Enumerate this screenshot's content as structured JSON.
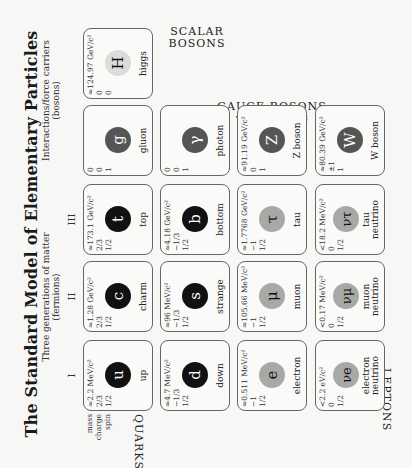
{
  "title": "The Standard Model of Elementary Particles",
  "fermions_caption": {
    "line1": "Three generations of matter",
    "line2": "(fermions)"
  },
  "bosons_caption": {
    "line1": "Interactions/force carriers",
    "line2": "(bosons)"
  },
  "generations": [
    "I",
    "II",
    "III"
  ],
  "row_labels": {
    "mass": "mass",
    "charge": "charge",
    "spin": "spin"
  },
  "group_labels": {
    "quarks": "QUARKS",
    "leptons": "LEPTONS",
    "scalar_bosons": "SCALAR BOSONS",
    "gauge_bosons": "GAUGE BOSONS",
    "vector_bosons": "VECTOR BOSONS"
  },
  "colors": {
    "quark": "#111111",
    "lepton": "#a8a8a6",
    "gauge": "#555555",
    "higgs": "#dcdcda"
  },
  "particles": {
    "up": {
      "mass": "≈2.2 MeV/c²",
      "charge": "2/3",
      "spin": "1/2",
      "symbol": "u",
      "name": "up"
    },
    "charm": {
      "mass": "≈1.28 GeV/c²",
      "charge": "2/3",
      "spin": "1/2",
      "symbol": "c",
      "name": "charm"
    },
    "top": {
      "mass": "≈173.1 GeV/c²",
      "charge": "2/3",
      "spin": "1/2",
      "symbol": "t",
      "name": "top"
    },
    "gluon": {
      "mass": "0",
      "charge": "0",
      "spin": "1",
      "symbol": "g",
      "name": "gluon"
    },
    "higgs": {
      "mass": "≈124.97 GeV/c²",
      "charge": "0",
      "spin": "0",
      "symbol": "H",
      "name": "higgs"
    },
    "down": {
      "mass": "≈4.7 MeV/c²",
      "charge": "−1/3",
      "spin": "1/2",
      "symbol": "d",
      "name": "down"
    },
    "strange": {
      "mass": "≈96 MeV/c²",
      "charge": "−1/3",
      "spin": "1/2",
      "symbol": "s",
      "name": "strange"
    },
    "bottom": {
      "mass": "≈4.18 GeV/c²",
      "charge": "−1/3",
      "spin": "1/2",
      "symbol": "b",
      "name": "bottom"
    },
    "photon": {
      "mass": "0",
      "charge": "0",
      "spin": "1",
      "symbol": "γ",
      "name": "photon"
    },
    "electron": {
      "mass": "≈0.511 MeV/c²",
      "charge": "−1",
      "spin": "1/2",
      "symbol": "e",
      "name": "electron"
    },
    "muon": {
      "mass": "≈105.66 MeV/c²",
      "charge": "−1",
      "spin": "1/2",
      "symbol": "μ",
      "name": "muon"
    },
    "tau": {
      "mass": "≈1.7768 GeV/c²",
      "charge": "−1",
      "spin": "1/2",
      "symbol": "τ",
      "name": "tau"
    },
    "zboson": {
      "mass": "≈91.19 GeV/c²",
      "charge": "0",
      "spin": "1",
      "symbol": "Z",
      "name": "Z boson"
    },
    "enu": {
      "mass": "<2.2 eV/c²",
      "charge": "0",
      "spin": "1/2",
      "symbol": "νe",
      "name1": "electron",
      "name2": "neutrino"
    },
    "munu": {
      "mass": "<0.17 MeV/c²",
      "charge": "0",
      "spin": "1/2",
      "symbol": "νμ",
      "name1": "muon",
      "name2": "neutrino"
    },
    "taunu": {
      "mass": "<18.2 MeV/c²",
      "charge": "0",
      "spin": "1/2",
      "symbol": "ντ",
      "name1": "tau",
      "name2": "neutrino"
    },
    "wboson": {
      "mass": "≈80.39 GeV/c²",
      "charge": "±1",
      "spin": "1",
      "symbol": "W",
      "name": "W boson"
    }
  }
}
